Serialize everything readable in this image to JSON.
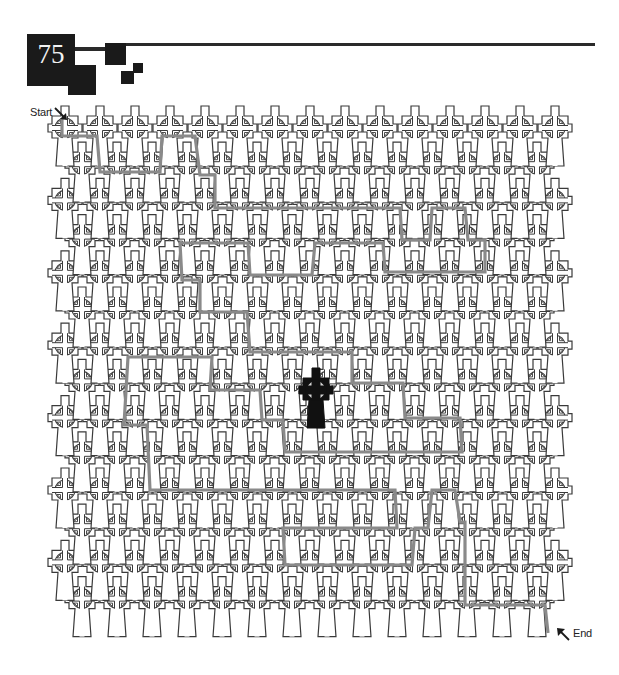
{
  "header": {
    "puzzle_number": "75"
  },
  "labels": {
    "start": "Start",
    "end": "End"
  },
  "icons": {
    "start_arrow": "arrow-down-right-icon",
    "end_arrow": "arrow-up-left-icon",
    "tile": "celtic-cross-icon",
    "goal": "celtic-cross-solid-icon"
  },
  "colors": {
    "ink": "#1a1a1a",
    "outline": "#3a3a3a",
    "path": "#8a8a8a",
    "background": "#ffffff"
  },
  "maze": {
    "rows": 14,
    "row_start_y": 128,
    "row_step_y": 36.2,
    "even_row_x0": 65,
    "odd_row_x0": 82,
    "col_step_x": 35,
    "even_row_cols": 15,
    "odd_row_cols": 14,
    "goal_cross": {
      "x": 316,
      "y": 390
    },
    "solution_path": [
      [
        62,
        118
      ],
      [
        62,
        136
      ],
      [
        97,
        136
      ],
      [
        100,
        172
      ],
      [
        160,
        172
      ],
      [
        162,
        136
      ],
      [
        195,
        136
      ],
      [
        200,
        175
      ],
      [
        215,
        175
      ],
      [
        215,
        208
      ],
      [
        400,
        208
      ],
      [
        402,
        240
      ],
      [
        430,
        240
      ],
      [
        432,
        208
      ],
      [
        465,
        208
      ],
      [
        468,
        240
      ],
      [
        485,
        240
      ],
      [
        485,
        272
      ],
      [
        385,
        272
      ],
      [
        383,
        243
      ],
      [
        315,
        243
      ],
      [
        312,
        275
      ],
      [
        250,
        275
      ],
      [
        248,
        243
      ],
      [
        180,
        243
      ],
      [
        182,
        280
      ],
      [
        200,
        280
      ],
      [
        200,
        312
      ],
      [
        247,
        312
      ],
      [
        250,
        352
      ],
      [
        352,
        352
      ],
      [
        352,
        383
      ],
      [
        403,
        383
      ],
      [
        405,
        418
      ],
      [
        460,
        418
      ],
      [
        462,
        452
      ],
      [
        285,
        452
      ],
      [
        283,
        420
      ],
      [
        262,
        420
      ],
      [
        260,
        390
      ],
      [
        210,
        390
      ],
      [
        212,
        357
      ],
      [
        128,
        357
      ],
      [
        124,
        425
      ],
      [
        147,
        425
      ],
      [
        150,
        490
      ],
      [
        395,
        490
      ],
      [
        397,
        528
      ],
      [
        283,
        528
      ],
      [
        285,
        565
      ],
      [
        412,
        565
      ],
      [
        415,
        528
      ],
      [
        428,
        528
      ],
      [
        432,
        490
      ],
      [
        455,
        490
      ],
      [
        460,
        522
      ],
      [
        465,
        522
      ],
      [
        465,
        605
      ],
      [
        545,
        605
      ],
      [
        548,
        633
      ]
    ]
  }
}
